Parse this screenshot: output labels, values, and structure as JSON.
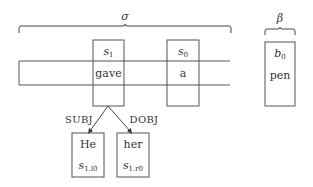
{
  "diagram": {
    "stack_label": "σ",
    "buffer_label": "β",
    "stack": {
      "s1": {
        "symbol": "s",
        "index": "1",
        "word": "gave"
      },
      "s0": {
        "symbol": "s",
        "index": "0",
        "word": "a"
      }
    },
    "buffer": {
      "b0": {
        "symbol": "b",
        "index": "0",
        "word": "pen"
      }
    },
    "children": [
      {
        "arc_label": "SUBJ",
        "word": "He",
        "symbol": "s",
        "index": "1.l0"
      },
      {
        "arc_label": "DOBJ",
        "word": "her",
        "symbol": "s",
        "index": "1.r0"
      }
    ]
  }
}
